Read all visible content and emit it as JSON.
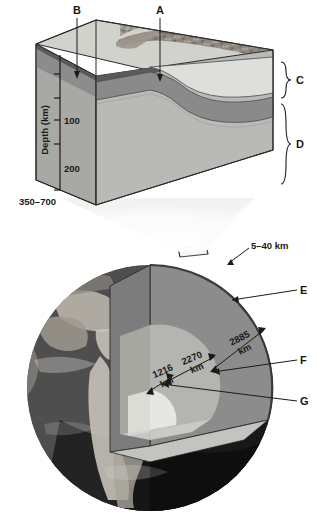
{
  "figure": {
    "block_diagram": {
      "callouts": [
        {
          "id": "A",
          "label": "A"
        },
        {
          "id": "B",
          "label": "B"
        },
        {
          "id": "C",
          "label": "C"
        },
        {
          "id": "D",
          "label": "D"
        }
      ],
      "axis": {
        "title": "Depth (km)",
        "ticks": [
          "100",
          "200"
        ],
        "bottom_label": "350–700"
      }
    },
    "globe_diagram": {
      "callouts": [
        {
          "id": "E",
          "label": "E"
        },
        {
          "id": "F",
          "label": "F"
        },
        {
          "id": "G",
          "label": "G"
        }
      ],
      "dimensions": [
        {
          "id": "crust",
          "value": "5–40 km",
          "line1": "5–40 km",
          "line2": ""
        },
        {
          "id": "mantle",
          "value": "2885 km",
          "line1": "2885",
          "line2": "km"
        },
        {
          "id": "outer-core",
          "value": "2270 km",
          "line1": "2270",
          "line2": "km"
        },
        {
          "id": "inner-core",
          "value": "1216 km",
          "line1": "1216",
          "line2": "km"
        }
      ]
    },
    "colors": {
      "crust_light": "#d9d9d4",
      "lithosphere_dark": "#8e8e8e",
      "asthenosphere": "#b9b9b5",
      "mantle_globe": "#8c8c8c",
      "outer_core": "#b4b4b0",
      "inner_core": "#e2e2de",
      "ocean_dark": "#3a3a3a",
      "ink": "#1a1a1a"
    }
  }
}
